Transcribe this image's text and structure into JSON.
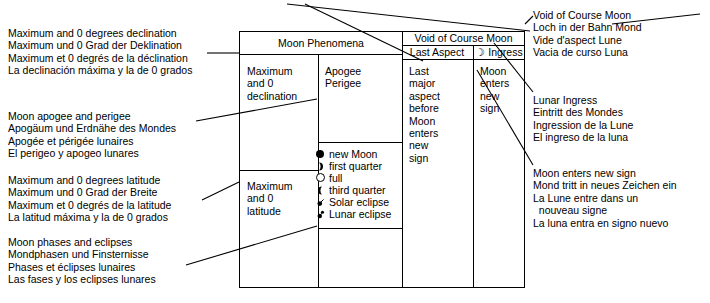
{
  "diagram": {
    "title_hidden": "Moon Phenomena legend key",
    "stroke_color": "#000000",
    "background": "#ffffff"
  },
  "table": {
    "headers": {
      "moon_phenomena": "Moon Phenomena",
      "void_of_course": "Void of Course Moon",
      "last_aspect": "Last Aspect",
      "ingress": "☽ Ingress"
    },
    "cells": {
      "declination": "Maximum\nand 0\ndeclination",
      "apogee_perigee": "Apogee\nPerigee",
      "latitude": "Maximum\nand 0\nlatitude",
      "last_aspect_body": "Last\nmajor\naspect\nbefore\nMoon\nenters\nnew\nsign",
      "ingress_body": "Moon\nenters\nnew\nsign"
    },
    "phase_legend": [
      {
        "icon": "new-moon-icon",
        "label": "new Moon"
      },
      {
        "icon": "first-quarter-icon",
        "label": "first quarter"
      },
      {
        "icon": "full-moon-icon",
        "label": "full"
      },
      {
        "icon": "third-quarter-icon",
        "label": "third quarter"
      },
      {
        "icon": "solar-eclipse-icon",
        "label": "Solar eclipse"
      },
      {
        "icon": "lunar-eclipse-icon",
        "label": "Lunar eclipse"
      }
    ]
  },
  "left_captions": [
    {
      "name": "declination-caption",
      "lines": [
        "Maximum and 0 degrees declination",
        "Maximum und 0 Grad der Deklination",
        "Maximum et 0 degrés de la déclination",
        "La declinación máxima y la de 0 grados"
      ]
    },
    {
      "name": "apogee-perigee-caption",
      "lines": [
        "Moon apogee and perigee",
        "Apogäum und Erdnähe des Mondes",
        "Apogée et périgée lunaires",
        "El perigeo y apogeo lunares"
      ]
    },
    {
      "name": "latitude-caption",
      "lines": [
        "Maximum and 0 degrees latitude",
        "Maximum und 0 Grad der Breite",
        "Maximum et 0 degrés de la latitude",
        "La latitud máxima y la de 0 grados"
      ]
    },
    {
      "name": "phases-eclipses-caption",
      "lines": [
        "Moon phases and eclipses",
        "Mondphasen und Finsternisse",
        "Phases et éclipses lunaires",
        "Las fases y los eclipses lunares"
      ]
    }
  ],
  "right_captions": [
    {
      "name": "void-of-course-caption",
      "lines": [
        "Void of Course Moon",
        "Loch in der Bahn Mond",
        "Vide d'aspect Lune",
        "Vacia de curso Luna"
      ]
    },
    {
      "name": "lunar-ingress-caption",
      "lines": [
        "Lunar Ingress",
        "Eintritt des Mondes",
        "Ingression de la Lune",
        "El ingreso de la luna"
      ]
    },
    {
      "name": "moon-enters-new-sign-caption",
      "lines": [
        "Moon enters new sign",
        "Mond tritt in neues Zeichen ein",
        "La Lune entre dans un",
        "  nouveau signe",
        "La luna entra en signo nuevo"
      ]
    }
  ]
}
